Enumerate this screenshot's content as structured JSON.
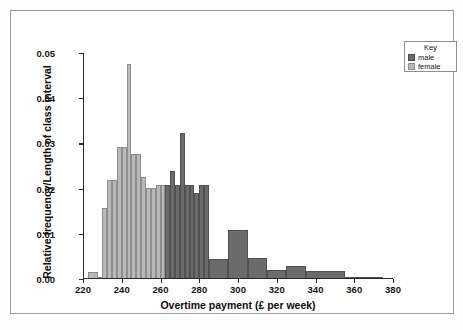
{
  "chart_data": {
    "type": "bar",
    "title": "",
    "subtitle": "",
    "xlabel": "Overtime payment (£ per week)",
    "ylabel": "Relative frequency/Length of class interval",
    "xlim": [
      220,
      380
    ],
    "ylim": [
      0.0,
      0.05
    ],
    "xticks": [
      220,
      240,
      260,
      280,
      300,
      320,
      340,
      360,
      380
    ],
    "xticklabels": [
      "220",
      "240",
      "260",
      "280",
      "300",
      "320",
      "340",
      "360",
      "380"
    ],
    "yticks": [
      0.0,
      0.01,
      0.02,
      0.03,
      0.04,
      0.05
    ],
    "yticklabels": [
      "0.00",
      "0.01",
      "0.02",
      "0.03",
      "0.04",
      "0.05"
    ],
    "grid": false,
    "legend": {
      "title": "Key",
      "position": "outside-top-right",
      "entries": [
        {
          "name": "male",
          "color": "#6b6b6b"
        },
        {
          "name": "female",
          "color": "#b9b9b9"
        }
      ]
    },
    "series": [
      {
        "name": "female",
        "color": "#b9b9b9",
        "bins": [
          {
            "x0": 222.5,
            "x1": 227.5,
            "value": 0.0015
          },
          {
            "x0": 227.5,
            "x1": 230.0,
            "value": 0.0005
          },
          {
            "x0": 230.0,
            "x1": 232.5,
            "value": 0.0158
          },
          {
            "x0": 232.5,
            "x1": 235.0,
            "value": 0.0218
          },
          {
            "x0": 235.0,
            "x1": 237.5,
            "value": 0.0218
          },
          {
            "x0": 237.5,
            "x1": 240.0,
            "value": 0.0291
          },
          {
            "x0": 240.0,
            "x1": 242.5,
            "value": 0.0291
          },
          {
            "x0": 242.5,
            "x1": 245.0,
            "value": 0.0475
          },
          {
            "x0": 245.0,
            "x1": 247.5,
            "value": 0.0276
          },
          {
            "x0": 247.5,
            "x1": 250.0,
            "value": 0.0276
          },
          {
            "x0": 250.0,
            "x1": 252.5,
            "value": 0.0226
          },
          {
            "x0": 252.5,
            "x1": 255.0,
            "value": 0.0201
          },
          {
            "x0": 255.0,
            "x1": 257.5,
            "value": 0.0201
          },
          {
            "x0": 257.5,
            "x1": 260.0,
            "value": 0.0207
          },
          {
            "x0": 260.0,
            "x1": 262.5,
            "value": 0.0207
          },
          {
            "x0": 262.5,
            "x1": 265.0,
            "value": 0.0207
          },
          {
            "x0": 265.0,
            "x1": 267.5,
            "value": 0.0115
          },
          {
            "x0": 267.5,
            "x1": 270.0,
            "value": 0.0141
          },
          {
            "x0": 270.0,
            "x1": 272.5,
            "value": 0.005
          },
          {
            "x0": 272.5,
            "x1": 275.0,
            "value": 0.004
          },
          {
            "x0": 275.0,
            "x1": 277.5,
            "value": 0.004
          },
          {
            "x0": 277.5,
            "x1": 280.0,
            "value": 0.004
          },
          {
            "x0": 280.0,
            "x1": 282.5,
            "value": 0.0016
          }
        ]
      },
      {
        "name": "male",
        "color": "#6b6b6b",
        "bins": [
          {
            "x0": 262.5,
            "x1": 265.0,
            "value": 0.0207
          },
          {
            "x0": 265.0,
            "x1": 267.5,
            "value": 0.0239
          },
          {
            "x0": 267.5,
            "x1": 270.0,
            "value": 0.0207
          },
          {
            "x0": 270.0,
            "x1": 272.5,
            "value": 0.0323
          },
          {
            "x0": 272.5,
            "x1": 275.0,
            "value": 0.0207
          },
          {
            "x0": 275.0,
            "x1": 277.5,
            "value": 0.0207
          },
          {
            "x0": 277.5,
            "x1": 280.0,
            "value": 0.019
          },
          {
            "x0": 280.0,
            "x1": 282.5,
            "value": 0.0207
          },
          {
            "x0": 282.5,
            "x1": 285.0,
            "value": 0.0207
          },
          {
            "x0": 285.0,
            "x1": 295.0,
            "value": 0.0044
          },
          {
            "x0": 295.0,
            "x1": 305.0,
            "value": 0.0109
          },
          {
            "x0": 305.0,
            "x1": 315.0,
            "value": 0.0047
          },
          {
            "x0": 315.0,
            "x1": 325.0,
            "value": 0.0021
          },
          {
            "x0": 325.0,
            "x1": 335.0,
            "value": 0.0029
          },
          {
            "x0": 335.0,
            "x1": 355.0,
            "value": 0.0017
          },
          {
            "x0": 355.0,
            "x1": 375.0,
            "value": 0.0004
          }
        ]
      }
    ]
  }
}
